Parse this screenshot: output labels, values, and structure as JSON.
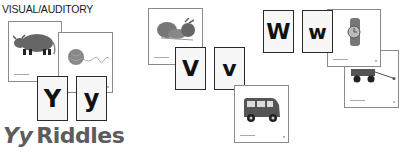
{
  "heading": "VISUAL/AUDITORY",
  "title": {
    "letters": "Yy",
    "word": "Riddles"
  },
  "letter_cards": [
    {
      "id": "Y-upper",
      "letter": "Y"
    },
    {
      "id": "y-lower",
      "letter": "y"
    },
    {
      "id": "V-upper",
      "letter": "V"
    },
    {
      "id": "v-lower",
      "letter": "v"
    },
    {
      "id": "W-upper",
      "letter": "W"
    },
    {
      "id": "w-lower",
      "letter": "w"
    }
  ],
  "picture_cards": [
    {
      "id": "yak",
      "icon": "yak-icon"
    },
    {
      "id": "yarn",
      "icon": "yarn-icon"
    },
    {
      "id": "vegetables",
      "icon": "vegetables-icon"
    },
    {
      "id": "van",
      "icon": "van-icon"
    },
    {
      "id": "watch",
      "icon": "watch-icon"
    },
    {
      "id": "wagon",
      "icon": "wagon-icon"
    }
  ],
  "colors": {
    "title": "#5c5c5c",
    "card_border": "#8a8a8a",
    "letter_border": "#2a2a2a",
    "illustration": "#6b6b6b"
  }
}
